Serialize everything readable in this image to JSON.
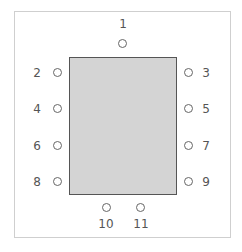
{
  "diagram": {
    "type": "seating-chart",
    "table_color": "#d4d4d4",
    "seats": [
      {
        "number": "1",
        "side": "top"
      },
      {
        "number": "2",
        "side": "left"
      },
      {
        "number": "3",
        "side": "right"
      },
      {
        "number": "4",
        "side": "left"
      },
      {
        "number": "5",
        "side": "right"
      },
      {
        "number": "6",
        "side": "left"
      },
      {
        "number": "7",
        "side": "right"
      },
      {
        "number": "8",
        "side": "left"
      },
      {
        "number": "9",
        "side": "right"
      },
      {
        "number": "10",
        "side": "bottom"
      },
      {
        "number": "11",
        "side": "bottom"
      }
    ]
  }
}
